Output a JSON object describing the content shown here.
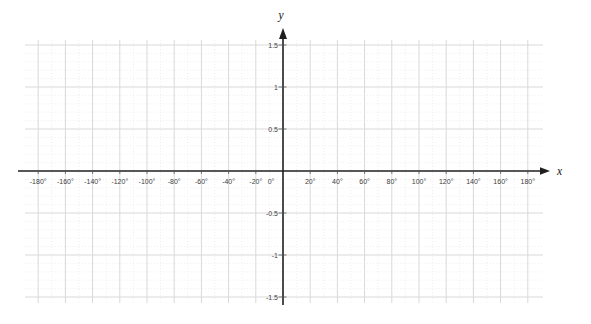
{
  "figure": {
    "background": "#ffffff"
  },
  "chart_data": {
    "type": "line",
    "title": "",
    "xlabel": "x",
    "ylabel": "y",
    "x_unit": "degrees",
    "xlim": [
      -190,
      195
    ],
    "ylim": [
      -1.58,
      1.62
    ],
    "x_ticks": [
      -180,
      -160,
      -140,
      -120,
      -100,
      -80,
      -60,
      -40,
      -20,
      0,
      20,
      40,
      60,
      80,
      100,
      120,
      140,
      160,
      180
    ],
    "x_tick_labels": [
      "-180°",
      "-160°",
      "-140°",
      "-120°",
      "-100°",
      "-80°",
      "-60°",
      "-40°",
      "-20°",
      "0°",
      "20°",
      "40°",
      "60°",
      "80°",
      "100°",
      "120°",
      "140°",
      "160°",
      "180°"
    ],
    "y_ticks": [
      1.5,
      1,
      0.5,
      -0.5,
      -1,
      -1.5
    ],
    "y_tick_labels": [
      "1.5",
      "1",
      "0.5",
      "-0.5",
      "-1",
      "-1.5"
    ],
    "grid": true,
    "minor_grid": true,
    "minor_x_step_degrees": 10,
    "minor_y_step": 0.1,
    "legend": false,
    "series": [],
    "colors": {
      "axis": "#1f1f1f",
      "grid_major": "#d9d9d9",
      "grid_minor": "#efefef",
      "tick_label": "#3d3d3d",
      "background": "#ffffff"
    }
  }
}
